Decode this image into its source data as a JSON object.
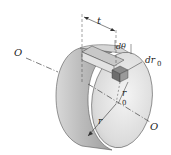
{
  "diagram": {
    "labels": {
      "axis_left": "O",
      "axis_right": "O",
      "thickness": "t",
      "angle_element": "dθ",
      "radial_element": "dr",
      "radial_element_sub": "0",
      "element_radius": "r",
      "element_radius_sub": "0",
      "outer_radius": "r"
    },
    "colors": {
      "face_light": "#ececec",
      "face_mid": "#cfcfcf",
      "rim_dark": "#a9a9a9",
      "element_dark": "#6e6e6e",
      "line": "#333333"
    }
  }
}
